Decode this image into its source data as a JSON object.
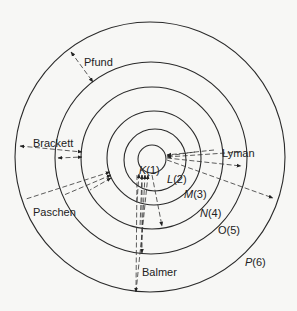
{
  "diagram": {
    "center": [
      150,
      158
    ],
    "levels": [
      {
        "letter": "K",
        "n": "(1)",
        "r": 14
      },
      {
        "letter": "L",
        "n": "(2)",
        "r": 30
      },
      {
        "letter": "M",
        "n": "(3)",
        "r": 46
      },
      {
        "letter": "N",
        "n": "(4)",
        "r": 70
      },
      {
        "letter": "O",
        "n": "(5)",
        "r": 95
      },
      {
        "letter": "P",
        "n": "(6)",
        "r": 134
      }
    ],
    "series": [
      {
        "name": "Lyman",
        "ends_on": "K(1)"
      },
      {
        "name": "Balmer",
        "ends_on": "L(2)"
      },
      {
        "name": "Paschen",
        "ends_on": "M(3)"
      },
      {
        "name": "Brackett",
        "ends_on": "N(4)"
      },
      {
        "name": "Pfund",
        "ends_on": "O(5)"
      }
    ],
    "colors": {
      "line": "#2a2a2a",
      "background": "#f7f7f5"
    }
  }
}
